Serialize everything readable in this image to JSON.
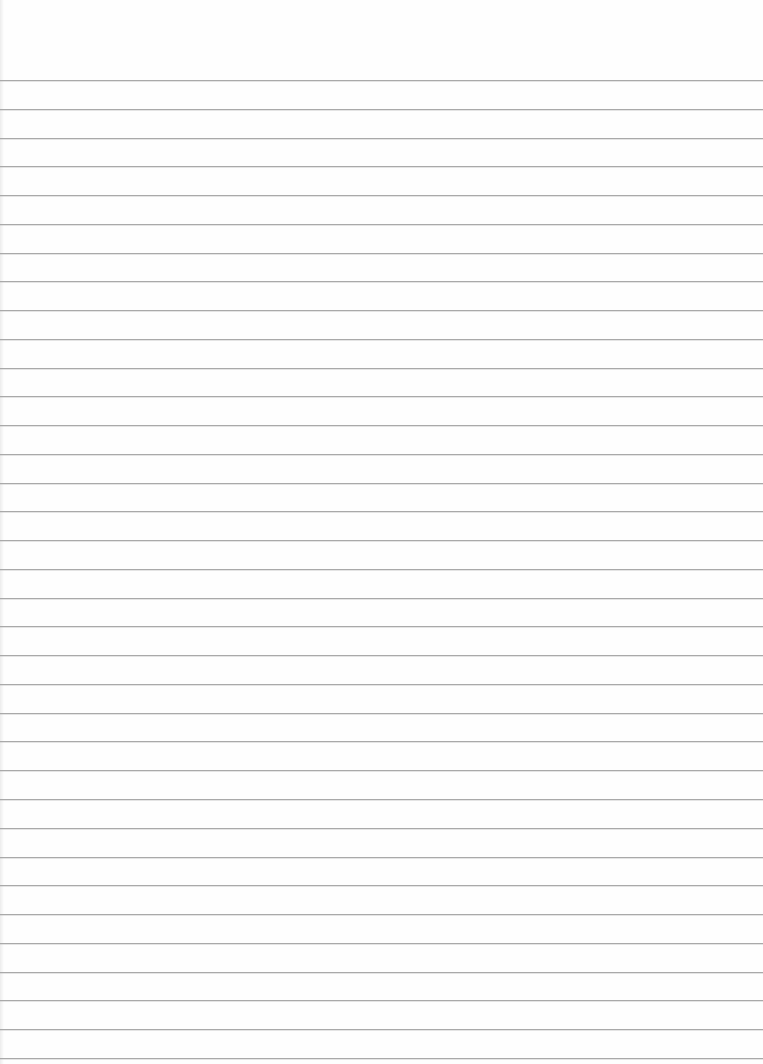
{
  "paper": {
    "type": "lined-paper",
    "background": "#fefefe",
    "line_color": "#a9a9a9",
    "first_line_y": 80,
    "line_spacing": 28.76,
    "line_count": 35
  }
}
